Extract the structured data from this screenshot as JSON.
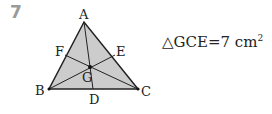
{
  "problem_number": "7",
  "figure": {
    "fill_color": "#cccccc",
    "vertices": {
      "A": "A",
      "B": "B",
      "C": "C"
    },
    "points": {
      "D": "D",
      "E": "E",
      "F": "F",
      "G": "G"
    }
  },
  "equation": {
    "symbol": "△",
    "triangle": "GCE",
    "equals": "=",
    "value": "7 cm",
    "exponent": "2"
  }
}
